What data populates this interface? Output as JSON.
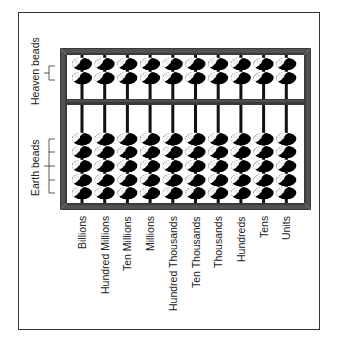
{
  "diagram": {
    "side_labels": {
      "heaven": "Heaven beads",
      "earth": "Earth beads"
    },
    "columns": [
      "Billions",
      "Hundred Millions",
      "Ten Millions",
      "Millions",
      "Hundred Thousands",
      "Ten Thousands",
      "Thousands",
      "Hundreds",
      "Tens",
      "Units"
    ],
    "beads_per_rod": {
      "heaven": 2,
      "earth": 5
    },
    "colors": {
      "frame": "#3a3a3a",
      "bead_dark": "#000000",
      "bead_light": "#ffffff",
      "rod": "#111111"
    }
  }
}
